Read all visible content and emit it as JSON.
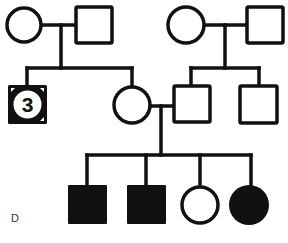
{
  "diagram": {
    "type": "pedigree",
    "panel_label": "D",
    "colors": {
      "stroke": "#111111",
      "affected_fill": "#111111",
      "unaffected_fill": "#ffffff",
      "background": "#ffffff"
    },
    "generations": [
      {
        "index": 1,
        "individuals": [
          {
            "id": "I-1",
            "sex": "female",
            "affected": false
          },
          {
            "id": "I-2",
            "sex": "male",
            "affected": false
          },
          {
            "id": "I-3",
            "sex": "female",
            "affected": false
          },
          {
            "id": "I-4",
            "sex": "male",
            "affected": false
          }
        ]
      },
      {
        "index": 2,
        "individuals": [
          {
            "id": "II-1",
            "sex": "male",
            "affected": true,
            "count_label": "3",
            "note": "group of 3 males"
          },
          {
            "id": "II-2",
            "sex": "female",
            "affected": false
          },
          {
            "id": "II-3",
            "sex": "male",
            "affected": false
          },
          {
            "id": "II-4",
            "sex": "male",
            "affected": false
          }
        ]
      },
      {
        "index": 3,
        "individuals": [
          {
            "id": "III-1",
            "sex": "male",
            "affected": true
          },
          {
            "id": "III-2",
            "sex": "male",
            "affected": true
          },
          {
            "id": "III-3",
            "sex": "female",
            "affected": false
          },
          {
            "id": "III-4",
            "sex": "female",
            "affected": true
          }
        ]
      }
    ],
    "count_label": "3"
  }
}
